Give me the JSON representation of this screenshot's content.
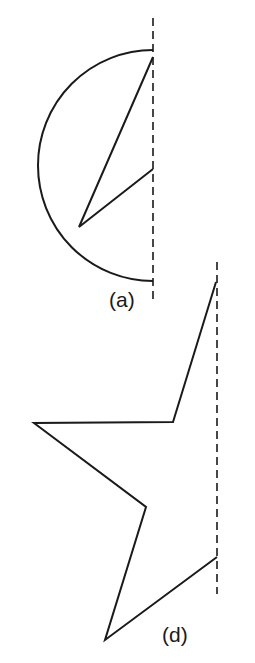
{
  "figures": [
    {
      "id": "a",
      "label": "(a)",
      "description": "Semicircle closed against a dashed axis with an internal zigzag",
      "axis": {
        "x": 153,
        "y1": 18,
        "y2": 302
      },
      "arc": {
        "top": [
          153,
          50
        ],
        "bottom": [
          153,
          281
        ],
        "leftmost_x": 38
      },
      "zigzag": [
        [
          153,
          57
        ],
        [
          79,
          227
        ],
        [
          153,
          169
        ]
      ]
    },
    {
      "id": "d",
      "label": "(d)",
      "description": "Half-star polyline against a dashed axis",
      "axis": {
        "x": 217,
        "y1": 262,
        "y2": 594
      },
      "polyline": [
        [
          216,
          282
        ],
        [
          173,
          422
        ],
        [
          34,
          423
        ],
        [
          146,
          507
        ],
        [
          105,
          640
        ],
        [
          217,
          557
        ]
      ]
    }
  ],
  "colors": {
    "line": "#1a1a1a",
    "background": "#ffffff"
  }
}
